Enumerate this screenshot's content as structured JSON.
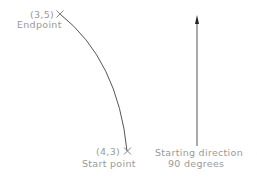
{
  "diagram": {
    "endpoint": {
      "coords": "(3,5)",
      "label": "Endpoint"
    },
    "start_point": {
      "coords": "(4,3)",
      "label": "Start point"
    },
    "direction": {
      "line1": "Starting direction",
      "line2": "90 degrees"
    },
    "colors": {
      "line": "#555555",
      "text": "#9a9a9a",
      "arrow": "#222222"
    }
  }
}
